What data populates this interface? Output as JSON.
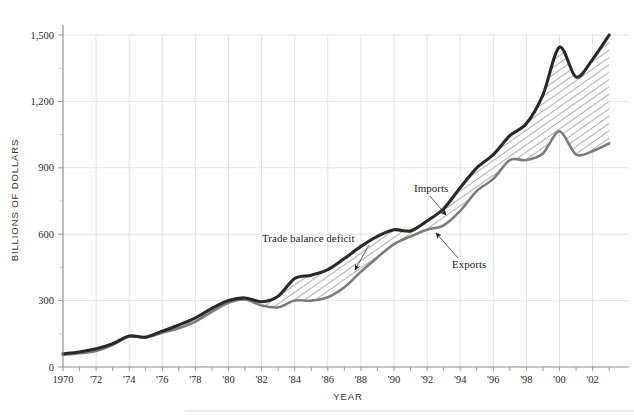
{
  "chart_data": {
    "type": "area",
    "title": "",
    "xlabel": "YEAR",
    "ylabel": "BILLIONS OF DOLLARS",
    "xlim": [
      1970,
      2003
    ],
    "ylim": [
      0,
      1560
    ],
    "yticks": [
      0,
      300,
      600,
      900,
      1200,
      1500
    ],
    "ytick_labels": [
      "0",
      "300",
      "600",
      "900",
      "1,200",
      "1,500"
    ],
    "xticks": [
      1970,
      1972,
      1974,
      1976,
      1978,
      1980,
      1982,
      1984,
      1986,
      1988,
      1990,
      1992,
      1994,
      1996,
      1998,
      2000,
      2002
    ],
    "xtick_labels": [
      "1970",
      "'72",
      "'74",
      "'76",
      "'78",
      "'80",
      "'82",
      "'84",
      "'86",
      "'88",
      "'90",
      "'92",
      "'94",
      "'96",
      "'98",
      "'00",
      "'02"
    ],
    "grid": true,
    "legend": "inline-annotations",
    "x": [
      1970,
      1971,
      1972,
      1973,
      1974,
      1975,
      1976,
      1977,
      1978,
      1979,
      1980,
      1981,
      1982,
      1983,
      1984,
      1985,
      1986,
      1987,
      1988,
      1989,
      1990,
      1991,
      1992,
      1993,
      1994,
      1995,
      1996,
      1997,
      1998,
      1999,
      2000,
      2001,
      2002,
      2003
    ],
    "series": [
      {
        "name": "Imports",
        "color": "#2b2827",
        "values": [
          60,
          68,
          82,
          105,
          140,
          135,
          162,
          190,
          222,
          265,
          300,
          312,
          295,
          320,
          400,
          415,
          440,
          490,
          545,
          590,
          620,
          615,
          660,
          715,
          810,
          900,
          960,
          1045,
          1100,
          1230,
          1445,
          1310,
          1390,
          1500
        ]
      },
      {
        "name": "Exports",
        "color": "#7e7b7a",
        "values": [
          55,
          62,
          72,
          100,
          138,
          133,
          155,
          175,
          205,
          250,
          290,
          305,
          278,
          270,
          300,
          300,
          315,
          360,
          430,
          495,
          555,
          590,
          620,
          640,
          705,
          795,
          850,
          935,
          935,
          965,
          1065,
          960,
          975,
          1010
        ]
      }
    ],
    "fill": {
      "name": "Trade balance deficit",
      "pattern": "diagonal-hatch",
      "between": [
        "Imports",
        "Exports"
      ]
    },
    "annotations": [
      {
        "label": "Trade balance deficit",
        "text_x": 262,
        "text_y": 242,
        "arrow_from_x": 369,
        "arrow_from_y": 245,
        "arrow_to_x": 355,
        "arrow_to_y": 270
      },
      {
        "label": "Imports",
        "text_x": 414,
        "text_y": 192,
        "arrow_from_x": 430,
        "arrow_from_y": 196,
        "arrow_to_x": 446,
        "arrow_to_y": 215
      },
      {
        "label": "Exports",
        "text_x": 452,
        "text_y": 268,
        "arrow_from_x": 458,
        "arrow_from_y": 258,
        "arrow_to_x": 436,
        "arrow_to_y": 233
      }
    ]
  }
}
